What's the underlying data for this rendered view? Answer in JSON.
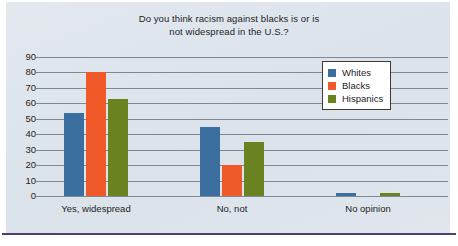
{
  "chart_data": {
    "type": "bar",
    "title": "Do you think racism against blacks is or is not widespread in the U.S.?",
    "title_lines": [
      "Do you think racism against blacks is or is",
      "not widespread in the U.S.?"
    ],
    "xlabel": "",
    "ylabel": "",
    "categories": [
      "Yes, widespread",
      "No, not",
      "No opinion"
    ],
    "series": [
      {
        "name": "Whites",
        "color": "#3a6f9f",
        "values": [
          54,
          45,
          2
        ]
      },
      {
        "name": "Blacks",
        "color": "#ef5a28",
        "values": [
          80,
          20,
          0
        ]
      },
      {
        "name": "Hispanics",
        "color": "#6b8221",
        "values": [
          63,
          35,
          2
        ]
      }
    ],
    "ylim": [
      0,
      90
    ],
    "ytick_step": 10,
    "yticks": [
      90,
      80,
      70,
      60,
      50,
      40,
      30,
      20,
      10,
      0
    ],
    "ytick_labels": [
      "90",
      "80",
      "70",
      "60",
      "50",
      "40",
      "30",
      "20",
      "10",
      "0"
    ],
    "grid": true,
    "legend_position": "upper right",
    "legend_entries": [
      "Whites",
      "Blacks",
      "Hispanics"
    ]
  },
  "figure": {
    "panel_color": "#dfe5ec",
    "rule_color": "#4a3f7a",
    "text_color": "#1d1d1d",
    "gridline_color": "#7d8894"
  }
}
